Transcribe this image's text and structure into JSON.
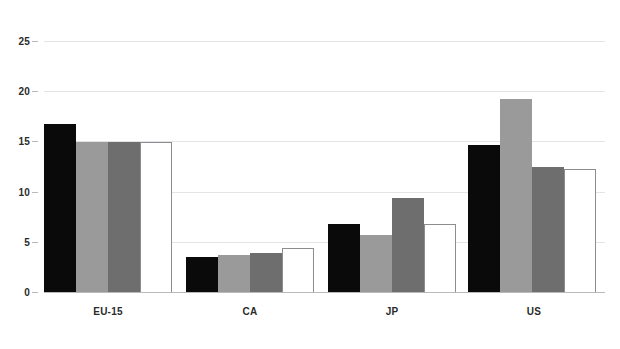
{
  "chart_data": {
    "type": "bar",
    "title": "",
    "subtitle": "",
    "xlabel": "",
    "ylabel": "",
    "categories": [
      "EU-15",
      "CA",
      "JP",
      "US"
    ],
    "series": [
      {
        "name": "series-1",
        "color": "#0a0a0a",
        "style": "solid-black",
        "values": [
          16.7,
          3.5,
          6.8,
          14.6
        ]
      },
      {
        "name": "series-2",
        "color": "#9a9a9a",
        "style": "solid-light-gray",
        "values": [
          14.9,
          3.7,
          5.7,
          19.2
        ]
      },
      {
        "name": "series-3",
        "color": "#6e6e6e",
        "style": "solid-dark-gray",
        "values": [
          14.9,
          3.9,
          9.4,
          12.5
        ]
      },
      {
        "name": "series-4",
        "color": "#ffffff",
        "style": "outlined-white",
        "values": [
          14.9,
          4.4,
          6.8,
          12.3
        ]
      }
    ],
    "ylim": [
      0,
      25
    ],
    "yticks": [
      0,
      5,
      10,
      15,
      20,
      25
    ],
    "ytick_labels": [
      "0",
      "5",
      "10",
      "15",
      "20",
      "25"
    ],
    "grid": true,
    "grid_axis": "y",
    "legend": false,
    "legend_position": "none",
    "background": "#ffffff",
    "gridline_color": "#e4e4e6",
    "axis_color": "#b9b9bd",
    "tick_label_color": "#2b2b2b"
  }
}
